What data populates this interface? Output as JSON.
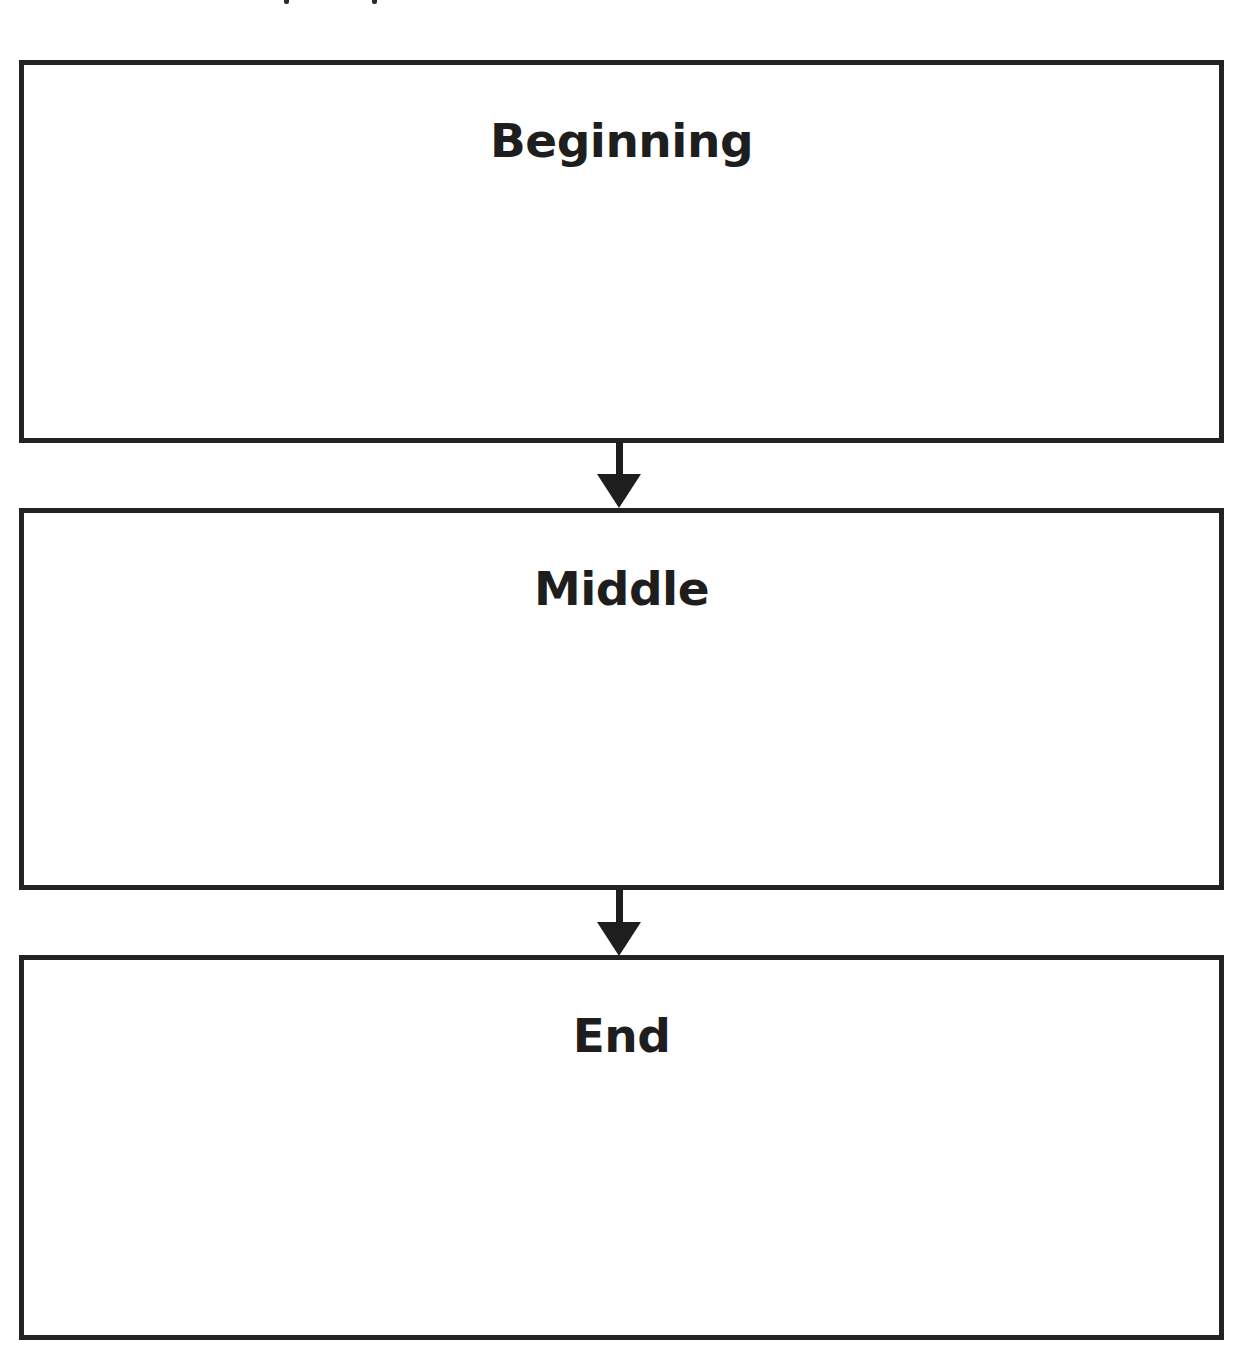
{
  "diagram": {
    "type": "vertical-flow",
    "header_cutoff_text": "",
    "stages": [
      {
        "label": "Beginning",
        "content": ""
      },
      {
        "label": "Middle",
        "content": ""
      },
      {
        "label": "End",
        "content": ""
      }
    ],
    "connectors": [
      {
        "from": "Beginning",
        "to": "Middle",
        "icon": "arrow-down-icon"
      },
      {
        "from": "Middle",
        "to": "End",
        "icon": "arrow-down-icon"
      }
    ],
    "colors": {
      "stroke": "#232323",
      "text": "#1e1e1e",
      "background": "#ffffff"
    }
  }
}
